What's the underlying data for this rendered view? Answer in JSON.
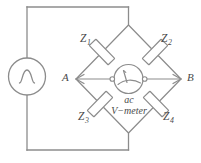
{
  "diagram": {
    "type": "ac-wheatstone-bridge",
    "line_color": "#8c8c8c",
    "text_color": "#4a4a4a",
    "background": "#ffffff",
    "source": {
      "name": "ac-voltage-source",
      "symbol": "sine-wave-in-circle"
    },
    "impedances": [
      {
        "id": "Z1",
        "base": "Z",
        "sub": "1",
        "arm": "top-left"
      },
      {
        "id": "Z2",
        "base": "Z",
        "sub": "2",
        "arm": "top-right"
      },
      {
        "id": "Z3",
        "base": "Z",
        "sub": "3",
        "arm": "bottom-left"
      },
      {
        "id": "Z4",
        "base": "Z",
        "sub": "4",
        "arm": "bottom-right"
      }
    ],
    "nodes": [
      {
        "id": "A",
        "label": "A",
        "position": "left-vertex"
      },
      {
        "id": "B",
        "label": "B",
        "position": "right-vertex"
      }
    ],
    "meter": {
      "name": "ac-voltmeter",
      "line1": "ac",
      "line2": "V−meter",
      "symbol": "needle-gauge"
    }
  }
}
